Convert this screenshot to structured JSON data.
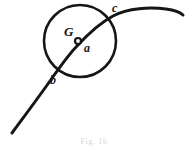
{
  "figure": {
    "kind": "geometry-diagram",
    "background_color": "#ffffff",
    "ink_color": "#161616",
    "labels": {
      "circle_label": "G",
      "center_label": "a",
      "upper_intersection_label": "c",
      "lower_intersection_label": "b"
    },
    "caption": "Fig. 16",
    "geometry": {
      "circle": {
        "cx": 80,
        "cy": 41,
        "r": 36,
        "stroke_width": 2.6
      },
      "center_point": {
        "cx": 78,
        "cy": 41,
        "r": 3.0,
        "filled": false,
        "stroke_width": 2.2
      },
      "curve": {
        "description": "curve rising from lower-left, crossing circle at b and c, flattening to the right",
        "points": [
          [
            12,
            133
          ],
          [
            48,
            84
          ],
          [
            78,
            44
          ],
          [
            112,
            14
          ],
          [
            145,
            9
          ],
          [
            183,
            15
          ]
        ],
        "stroke_width": 3.0
      },
      "intersections": {
        "b": [
          55,
          72
        ],
        "c": [
          108,
          20
        ]
      }
    }
  }
}
